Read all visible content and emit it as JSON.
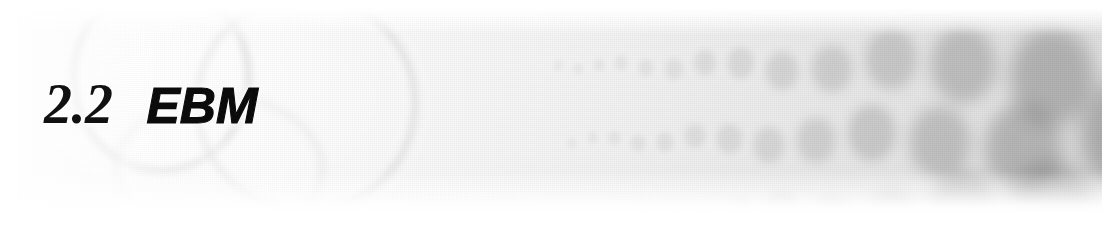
{
  "banner": {
    "kind": "book-section-header-banner",
    "width": 1112,
    "height": 231,
    "heading": {
      "number": "2.2",
      "title": "EBM"
    },
    "palette": {
      "page_background": "#ffffff",
      "plate_light": "#fdfdfd",
      "plate_dark": "#e3e3e3",
      "dot_gray": "#6f6f6f",
      "ring_gray": "#9a9a9a",
      "heading_color": "#0b0b0b"
    },
    "artwork": {
      "description": "grayscale halftone photograph strip",
      "rings": [
        {
          "name": "ring-upper-left",
          "cx": 143,
          "cy": 69,
          "rx": 91,
          "ry": 97
        },
        {
          "name": "ring-upper-right",
          "cx": 288,
          "cy": 95,
          "rx": 112,
          "ry": 111
        },
        {
          "name": "ring-lower",
          "cx": 201,
          "cy": 161,
          "rx": 105,
          "ry": 75
        }
      ],
      "dot_grid": {
        "rows": 3,
        "row_centers_y": [
          58,
          132,
          198
        ],
        "start_x": 540,
        "end_x": 1084,
        "min_diameter": 9,
        "max_diameter": 96,
        "min_opacity": 0.06,
        "max_opacity": 0.46,
        "blur_min": 2,
        "blur_max": 11
      }
    }
  }
}
